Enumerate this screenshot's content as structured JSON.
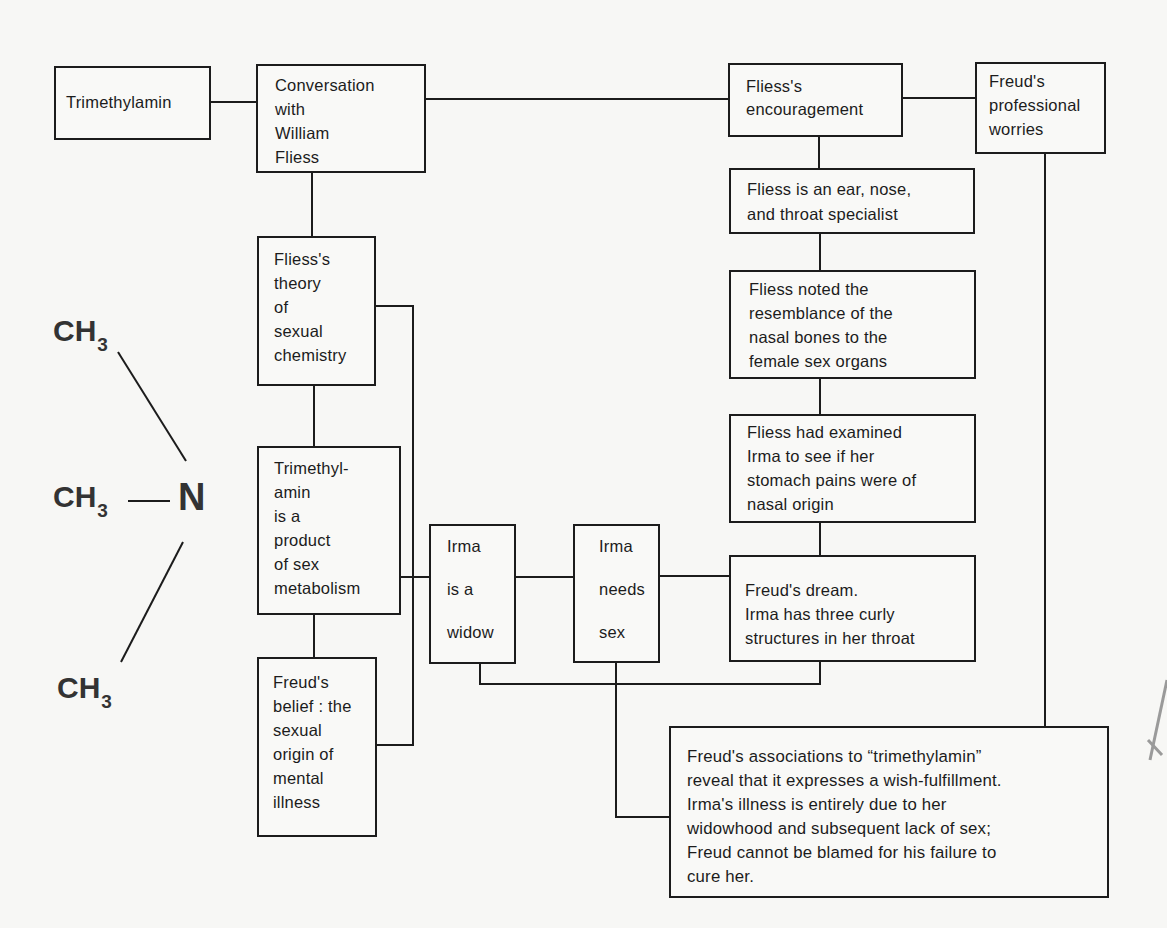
{
  "diagram": {
    "nodes": {
      "trimethylamin": "Trimethylamin",
      "conversation": "Conversation\nwith\nWilliam\nFliess",
      "encouragement": "Fliess's\nencouragement",
      "worries": "Freud's\nprofessional\nworries",
      "ent_specialist": "Fliess is an ear, nose,\nand throat specialist",
      "nasal_bones": "Fliess noted the\nresemblance of the\nnasal bones to the\nfemale sex organs",
      "examined_irma": "Fliess had examined\nIrma to see if her\nstomach pains were of\nnasal origin",
      "dream": "Freud's dream.\nIrma has three curly\nstructures in her throat",
      "theory": "Fliess's\ntheory\nof\nsexual\nchemistry",
      "product": "Trimethyl-\namin\nis a\nproduct\nof sex\nmetabolism",
      "belief": "Freud's\nbelief : the\nsexual\norigin of\nmental\nillness",
      "widow": "Irma\n\nis a\n\nwidow",
      "needs_sex": "Irma\n\nneeds\n\nsex",
      "conclusion": "Freud's associations to “trimethylamin”\nreveal that it expresses a wish-fulfillment.\nIrma's illness is entirely due to her\nwidowhood and subsequent lack of sex;\nFreud cannot be blamed for his failure to\ncure her."
    },
    "chemical_structure": {
      "center_atom": "N",
      "groups": [
        {
          "label": "CH",
          "subscript": "3",
          "position": "top"
        },
        {
          "label": "CH",
          "subscript": "3",
          "position": "middle"
        },
        {
          "label": "CH",
          "subscript": "3",
          "position": "bottom"
        }
      ]
    },
    "colors": {
      "ink": "#1c1c1c",
      "paper": "#f7f7f5"
    }
  }
}
